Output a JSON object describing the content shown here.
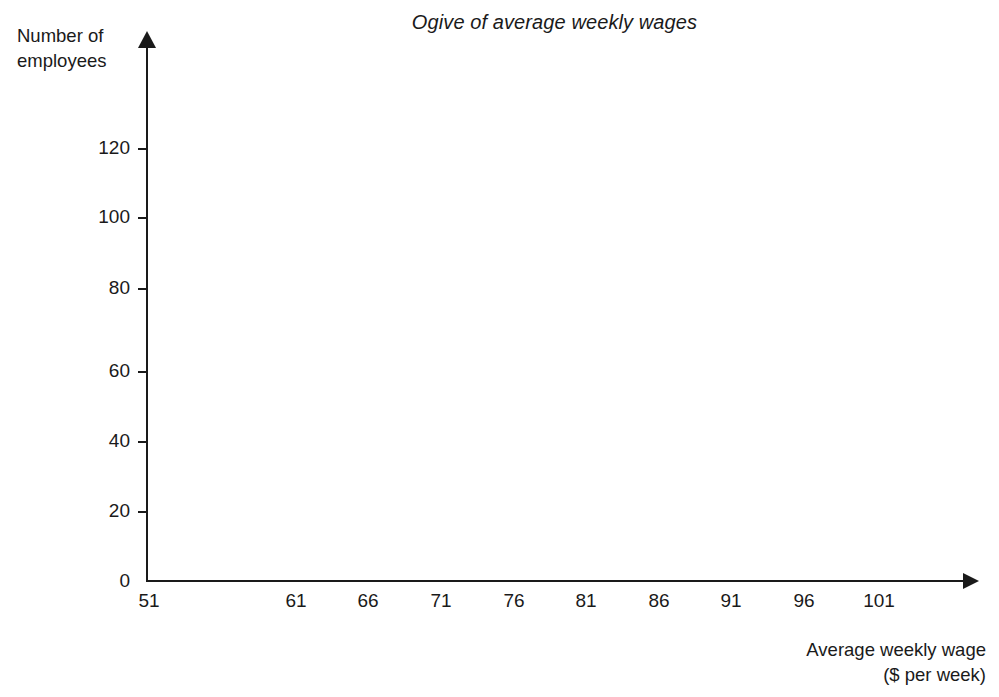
{
  "chart_data": {
    "type": "line",
    "title": "Ogive of average weekly wages",
    "xlabel": "Average weekly wage",
    "xlabel_line2": "($ per week)",
    "ylabel": "Number of",
    "ylabel_line2": "employees",
    "x_tick_labels": [
      "51",
      "61",
      "66",
      "71",
      "76",
      "81",
      "86",
      "91",
      "96",
      "101"
    ],
    "y_tick_labels": [
      "0",
      "20",
      "40",
      "60",
      "80",
      "100",
      "120"
    ],
    "y_values": [
      0,
      20,
      40,
      60,
      80,
      100,
      120
    ],
    "ylim": [
      0,
      130
    ],
    "xlim": [
      51,
      106
    ],
    "grid": false,
    "legend": false,
    "series": [
      {
        "name": "Cumulative frequency",
        "x": [],
        "values": []
      }
    ],
    "note": "Blank ogive axes — no data plotted in the plot area"
  },
  "axes": {
    "y_ticks": [
      {
        "label": "0",
        "top": 581
      },
      {
        "label": "20",
        "top": 511
      },
      {
        "label": "40",
        "top": 441
      },
      {
        "label": "60",
        "top": 371
      },
      {
        "label": "80",
        "top": 288
      },
      {
        "label": "100",
        "top": 217
      },
      {
        "label": "120",
        "top": 148
      }
    ],
    "x_ticks": [
      {
        "label": "51",
        "left": 149
      },
      {
        "label": "61",
        "left": 296
      },
      {
        "label": "66",
        "left": 368
      },
      {
        "label": "71",
        "left": 441
      },
      {
        "label": "76",
        "left": 514
      },
      {
        "label": "81",
        "left": 586
      },
      {
        "label": "86",
        "left": 659
      },
      {
        "label": "91",
        "left": 731
      },
      {
        "label": "96",
        "left": 804
      },
      {
        "label": "101",
        "left": 879
      }
    ]
  },
  "style": {
    "axis_color": "#1a1a1a",
    "text_color": "#1a1a1a",
    "background": "#ffffff"
  }
}
